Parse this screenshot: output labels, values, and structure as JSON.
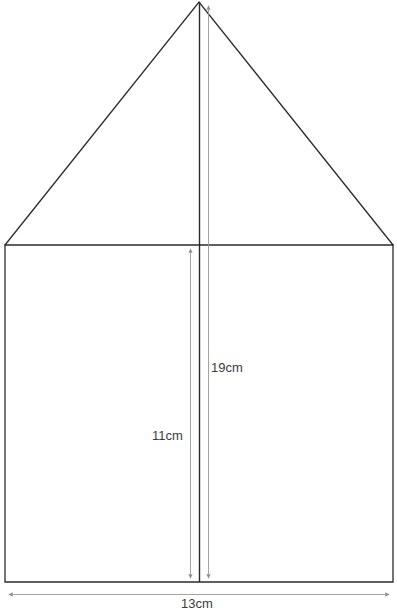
{
  "figure": {
    "kind": "pentagon-house-shape",
    "canvas": {
      "width": 397,
      "height": 615
    },
    "colors": {
      "outline": "#2b2b2b",
      "center_line": "#2b2b2b",
      "dimension_line": "#9a9a9a",
      "label_text": "#3b3b3b",
      "background": "#ffffff"
    },
    "shape": {
      "apex": {
        "x": 199,
        "y": 2
      },
      "triangle_base_left": {
        "x": 5,
        "y": 245
      },
      "triangle_base_right": {
        "x": 393,
        "y": 245
      },
      "rect_left": 5,
      "rect_right": 393,
      "rect_top": 245,
      "rect_bottom": 582
    },
    "center_line": {
      "x": 199,
      "y_top": 2,
      "y_bottom": 582
    }
  },
  "dimensions": [
    {
      "id": "total-height",
      "label": "19cm",
      "value": 19,
      "unit": "cm",
      "orientation": "vertical",
      "measures": "apex to rectangle base",
      "line_x": 208,
      "y_start": 2,
      "y_end": 582,
      "arrow_start": true,
      "arrow_end": true,
      "label_x": 211,
      "label_y": 361
    },
    {
      "id": "rectangle-height",
      "label": "11cm",
      "value": 11,
      "unit": "cm",
      "orientation": "vertical",
      "measures": "rectangle top to rectangle base",
      "line_x": 190,
      "y_start": 245,
      "y_end": 582,
      "arrow_start": true,
      "arrow_end": true,
      "label_x": 152,
      "label_y": 429
    },
    {
      "id": "base-width",
      "label": "13cm",
      "value": 13,
      "unit": "cm",
      "orientation": "horizontal",
      "measures": "rectangle width",
      "line_y": 594,
      "x_start": 5,
      "x_end": 392,
      "arrow_start": true,
      "arrow_end": true,
      "label_x": 181,
      "label_y": 597
    }
  ]
}
